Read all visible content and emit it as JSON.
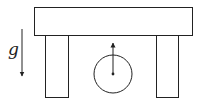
{
  "diagram": {
    "gravity_label": "g",
    "elements": {
      "table_top": "rectangle",
      "left_leg": "rectangle",
      "right_leg": "rectangle",
      "wheel": "circle",
      "wheel_arrow": "upward arrow from center",
      "gravity_arrow": "downward arrow"
    },
    "colors": {
      "stroke": "#222222",
      "background": "#ffffff"
    }
  }
}
